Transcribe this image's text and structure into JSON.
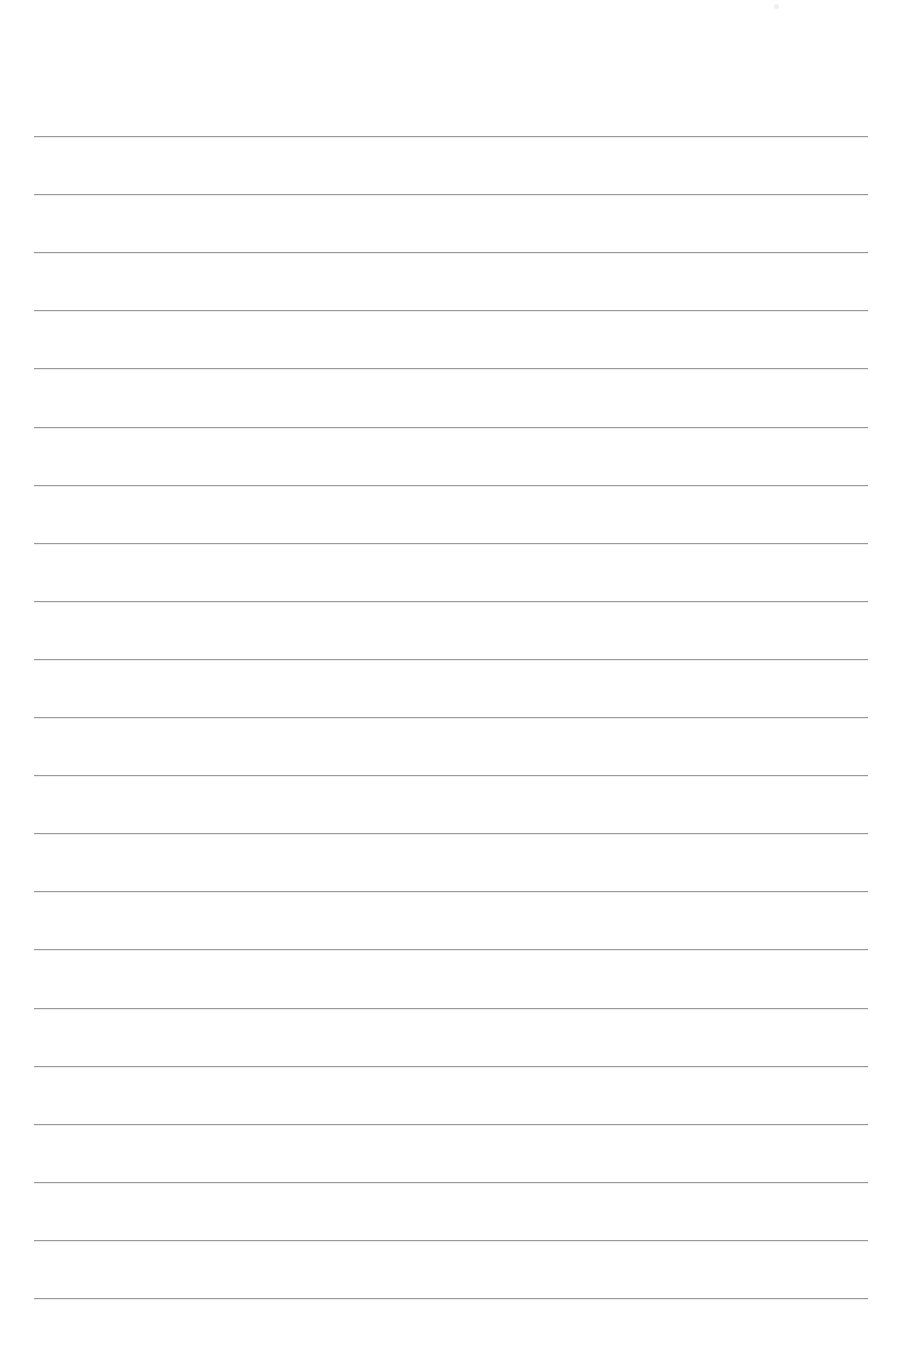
{
  "document": {
    "type": "lined-paper",
    "background_color": "#ffffff",
    "rule_color": "#8f8f8f",
    "rules": {
      "count": 21,
      "first_y": 136,
      "spacing": 58.1,
      "left": 34,
      "right": 868
    },
    "text": ""
  }
}
